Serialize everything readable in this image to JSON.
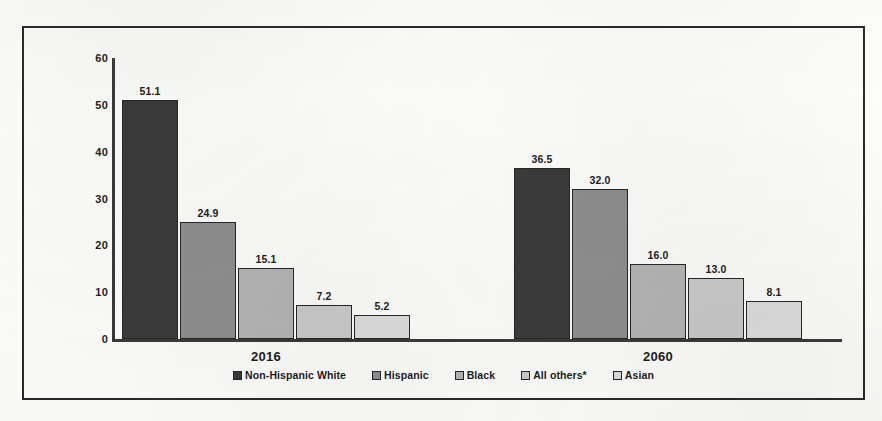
{
  "chart_data": {
    "type": "bar",
    "title": "",
    "subtitle": "",
    "xlabel": "",
    "ylabel": "",
    "categories": [
      "2016",
      "2060"
    ],
    "series": [
      {
        "name": "Non-Hispanic White",
        "values": [
          51.1,
          36.5
        ],
        "color": "#3b3b3b"
      },
      {
        "name": "Hispanic",
        "values": [
          24.9,
          32.0
        ],
        "color": "#8e8e8e"
      },
      {
        "name": "Black",
        "values": [
          15.1,
          16.0
        ],
        "color": "#b4b4b4"
      },
      {
        "name": "All others*",
        "values": [
          7.2,
          13.0
        ],
        "color": "#c9c9c9"
      },
      {
        "name": "Asian",
        "values": [
          5.2,
          8.1
        ],
        "color": "#dcdcdc"
      }
    ],
    "value_labels": [
      [
        "51.1",
        "24.9",
        "15.1",
        "7.2",
        "5.2"
      ],
      [
        "36.5",
        "32.0",
        "16.0",
        "13.0",
        "8.1"
      ]
    ],
    "ylim": [
      0,
      60
    ],
    "yticks": [
      0,
      10,
      20,
      30,
      40,
      50,
      60
    ],
    "ytick_labels": [
      "0",
      "10",
      "20",
      "30",
      "40",
      "50",
      "60"
    ],
    "grid": false,
    "legend_position": "bottom"
  },
  "legend": {
    "items": [
      {
        "label": "Non-Hispanic White",
        "color": "#3b3b3b"
      },
      {
        "label": "Hispanic",
        "color": "#8e8e8e"
      },
      {
        "label": "Black",
        "color": "#b4b4b4"
      },
      {
        "label": "All others*",
        "color": "#c9c9c9"
      },
      {
        "label": "Asian",
        "color": "#dcdcdc"
      }
    ]
  },
  "axis": {
    "y_tick_labels": [
      "60",
      "50",
      "40",
      "30",
      "20",
      "10",
      "0"
    ]
  },
  "groups": [
    {
      "caption": "2016"
    },
    {
      "caption": "2060"
    }
  ],
  "colors": {
    "frame": "#2b2b2b",
    "axis": "#3a3a3a",
    "text": "#1d1d1d",
    "page": "#fdfdfb"
  }
}
